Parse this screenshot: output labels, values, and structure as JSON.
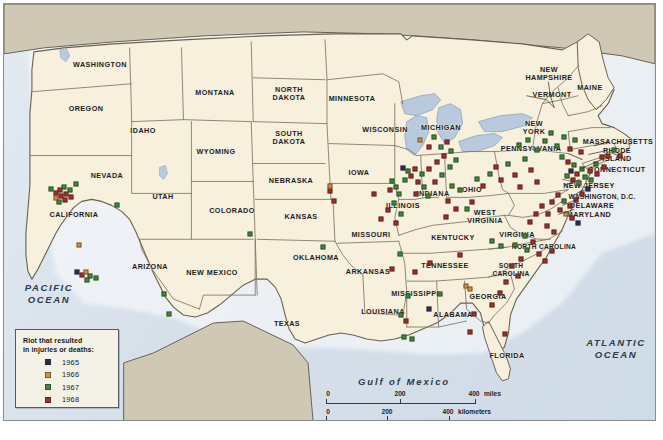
{
  "map": {
    "title": "Riots in the United States 1965-1968",
    "ocean_labels": [
      {
        "name": "pacific-ocean-label",
        "text": "PACIFIC\nOCEAN",
        "x": 45,
        "y": 290
      },
      {
        "name": "atlantic-ocean-label",
        "text": "ATLANTIC\nOCEAN",
        "x": 612,
        "y": 345
      },
      {
        "name": "gulf-of-mexico-label",
        "text": "Gulf of Mexico",
        "x": 400,
        "y": 377
      }
    ],
    "colors": {
      "us_land": "#f6f0dc",
      "foreign_land": "#cfc8b4",
      "water": "#d8e2ec",
      "border": "#6b6050",
      "state_border": "#7d7462",
      "frame": "#8a8d8f",
      "legend_bg": "#f4f1e6",
      "text": "#1d1d1f"
    },
    "states": [
      {
        "name": "WASHINGTON",
        "x": 96,
        "y": 61
      },
      {
        "name": "OREGON",
        "x": 82,
        "y": 105
      },
      {
        "name": "IDAHO",
        "x": 139,
        "y": 127
      },
      {
        "name": "MONTANA",
        "x": 211,
        "y": 89
      },
      {
        "name": "WYOMING",
        "x": 212,
        "y": 148
      },
      {
        "name": "NEVADA",
        "x": 103,
        "y": 172
      },
      {
        "name": "CALIFORNIA",
        "x": 70,
        "y": 211
      },
      {
        "name": "UTAH",
        "x": 159,
        "y": 193
      },
      {
        "name": "ARIZONA",
        "x": 146,
        "y": 263
      },
      {
        "name": "COLORADO",
        "x": 228,
        "y": 207
      },
      {
        "name": "NEW MEXICO",
        "x": 208,
        "y": 269
      },
      {
        "name": "NORTH\nDAKOTA",
        "x": 285,
        "y": 90
      },
      {
        "name": "SOUTH\nDAKOTA",
        "x": 285,
        "y": 134
      },
      {
        "name": "NEBRASKA",
        "x": 287,
        "y": 177
      },
      {
        "name": "KANSAS",
        "x": 297,
        "y": 213
      },
      {
        "name": "OKLAHOMA",
        "x": 312,
        "y": 254
      },
      {
        "name": "TEXAS",
        "x": 283,
        "y": 320
      },
      {
        "name": "MINNESOTA",
        "x": 348,
        "y": 95
      },
      {
        "name": "IOWA",
        "x": 355,
        "y": 169
      },
      {
        "name": "MISSOURI",
        "x": 367,
        "y": 231
      },
      {
        "name": "ARKANSAS",
        "x": 364,
        "y": 268
      },
      {
        "name": "LOUISIANA",
        "x": 379,
        "y": 308
      },
      {
        "name": "WISCONSIN",
        "x": 381,
        "y": 126
      },
      {
        "name": "ILLINOIS",
        "x": 399,
        "y": 202
      },
      {
        "name": "MISSISSIPPI",
        "x": 411,
        "y": 290
      },
      {
        "name": "MICHIGAN",
        "x": 437,
        "y": 124
      },
      {
        "name": "INDIANA",
        "x": 429,
        "y": 190
      },
      {
        "name": "KENTUCKY",
        "x": 449,
        "y": 234
      },
      {
        "name": "TENNESSEE",
        "x": 441,
        "y": 262
      },
      {
        "name": "ALABAMA",
        "x": 449,
        "y": 311
      },
      {
        "name": "OHIO",
        "x": 468,
        "y": 186
      },
      {
        "name": "GEORGIA",
        "x": 484,
        "y": 293
      },
      {
        "name": "FLORIDA",
        "x": 503,
        "y": 352
      },
      {
        "name": "WEST\nVIRGINIA",
        "x": 481,
        "y": 213
      },
      {
        "name": "SOUTH\nCAROLINA",
        "x": 507,
        "y": 266
      },
      {
        "name": "NORTH CAROLINA",
        "x": 540,
        "y": 243
      },
      {
        "name": "VIRGINIA",
        "x": 513,
        "y": 231
      },
      {
        "name": "PENNSYLVANIA",
        "x": 527,
        "y": 145
      },
      {
        "name": "NEW\nYORK",
        "x": 530,
        "y": 124
      },
      {
        "name": "VERMONT",
        "x": 548,
        "y": 91
      },
      {
        "name": "NEW\nHAMPSHIRE",
        "x": 545,
        "y": 70
      },
      {
        "name": "MAINE",
        "x": 586,
        "y": 84
      },
      {
        "name": "MASSACHUSETTS",
        "x": 614,
        "y": 138
      },
      {
        "name": "RHODE\nISLAND",
        "x": 613,
        "y": 151
      },
      {
        "name": "CONNECTICUT",
        "x": 613,
        "y": 166
      },
      {
        "name": "NEW JERSEY",
        "x": 585,
        "y": 182
      },
      {
        "name": "WASHINGTON, D.C.",
        "x": 598,
        "y": 193
      },
      {
        "name": "DELAWARE",
        "x": 588,
        "y": 202
      },
      {
        "name": "MARYLAND",
        "x": 585,
        "y": 211
      }
    ]
  },
  "legend": {
    "name": "map-legend",
    "title_line1": "Riot that resulted",
    "title_line2": "in injuries or deaths:",
    "items": [
      {
        "year": "1965",
        "color": "#2b2c55"
      },
      {
        "year": "1966",
        "color": "#d4923f"
      },
      {
        "year": "1967",
        "color": "#3f8a3a"
      },
      {
        "year": "1968",
        "color": "#a03028"
      }
    ]
  },
  "scale": {
    "name": "map-scale-bar",
    "miles": {
      "ticks": [
        "0",
        "200",
        "400"
      ],
      "unit": "miles"
    },
    "kilometers": {
      "ticks": [
        "0",
        "200",
        "400"
      ],
      "unit": "kilometers"
    }
  },
  "markers": [
    {
      "y": "1967",
      "x": 47,
      "yy": 185
    },
    {
      "y": "1968",
      "x": 52,
      "yy": 189
    },
    {
      "y": "1968",
      "x": 56,
      "yy": 186
    },
    {
      "y": "1967",
      "x": 60,
      "yy": 183
    },
    {
      "y": "1968",
      "x": 57,
      "yy": 192
    },
    {
      "y": "1966",
      "x": 52,
      "yy": 194
    },
    {
      "y": "1968",
      "x": 62,
      "yy": 190
    },
    {
      "y": "1967",
      "x": 66,
      "yy": 186
    },
    {
      "y": "1968",
      "x": 61,
      "yy": 196
    },
    {
      "y": "1967",
      "x": 55,
      "yy": 198
    },
    {
      "y": "1967",
      "x": 72,
      "yy": 180
    },
    {
      "y": "1968",
      "x": 67,
      "yy": 193
    },
    {
      "y": "1966",
      "x": 75,
      "yy": 241
    },
    {
      "y": "1965",
      "x": 73,
      "yy": 268
    },
    {
      "y": "1968",
      "x": 78,
      "yy": 271
    },
    {
      "y": "1966",
      "x": 82,
      "yy": 268
    },
    {
      "y": "1967",
      "x": 86,
      "yy": 272
    },
    {
      "y": "1967",
      "x": 83,
      "yy": 276
    },
    {
      "y": "1967",
      "x": 92,
      "yy": 274
    },
    {
      "y": "1967",
      "x": 160,
      "yy": 290
    },
    {
      "y": "1967",
      "x": 165,
      "yy": 310
    },
    {
      "y": "1967",
      "x": 113,
      "yy": 201
    },
    {
      "y": "1967",
      "x": 246,
      "yy": 230
    },
    {
      "y": "1968",
      "x": 326,
      "yy": 187
    },
    {
      "y": "1966",
      "x": 326,
      "yy": 182
    },
    {
      "y": "1968",
      "x": 330,
      "yy": 197
    },
    {
      "y": "1967",
      "x": 319,
      "yy": 243
    },
    {
      "y": "1968",
      "x": 370,
      "yy": 190
    },
    {
      "y": "1968",
      "x": 377,
      "yy": 215
    },
    {
      "y": "1967",
      "x": 388,
      "yy": 177
    },
    {
      "y": "1968",
      "x": 386,
      "yy": 186
    },
    {
      "y": "1967",
      "x": 392,
      "yy": 183
    },
    {
      "y": "1967",
      "x": 395,
      "yy": 190
    },
    {
      "y": "1967",
      "x": 390,
      "yy": 199
    },
    {
      "y": "1968",
      "x": 384,
      "yy": 206
    },
    {
      "y": "1967",
      "x": 397,
      "yy": 210
    },
    {
      "y": "1968",
      "x": 392,
      "yy": 219
    },
    {
      "y": "1965",
      "x": 399,
      "yy": 164
    },
    {
      "y": "1967",
      "x": 404,
      "yy": 167
    },
    {
      "y": "1968",
      "x": 407,
      "yy": 172
    },
    {
      "y": "1967",
      "x": 401,
      "yy": 176
    },
    {
      "y": "1968",
      "x": 411,
      "yy": 165
    },
    {
      "y": "1968",
      "x": 414,
      "yy": 178
    },
    {
      "y": "1967",
      "x": 418,
      "yy": 170
    },
    {
      "y": "1967",
      "x": 420,
      "yy": 183
    },
    {
      "y": "1968",
      "x": 412,
      "yy": 190
    },
    {
      "y": "1967",
      "x": 424,
      "yy": 192
    },
    {
      "y": "1966",
      "x": 416,
      "yy": 136
    },
    {
      "y": "1968",
      "x": 425,
      "yy": 143
    },
    {
      "y": "1967",
      "x": 430,
      "yy": 133
    },
    {
      "y": "1967",
      "x": 437,
      "yy": 143
    },
    {
      "y": "1968",
      "x": 443,
      "yy": 138
    },
    {
      "y": "1967",
      "x": 447,
      "yy": 147
    },
    {
      "y": "1968",
      "x": 440,
      "yy": 152
    },
    {
      "y": "1967",
      "x": 452,
      "yy": 156
    },
    {
      "y": "1968",
      "x": 433,
      "yy": 158
    },
    {
      "y": "1967",
      "x": 446,
      "yy": 163
    },
    {
      "y": "1968",
      "x": 425,
      "yy": 165
    },
    {
      "y": "1967",
      "x": 438,
      "yy": 171
    },
    {
      "y": "1968",
      "x": 431,
      "yy": 178
    },
    {
      "y": "1967",
      "x": 448,
      "yy": 182
    },
    {
      "y": "1967",
      "x": 456,
      "yy": 186
    },
    {
      "y": "1968",
      "x": 444,
      "yy": 197
    },
    {
      "y": "1968",
      "x": 452,
      "yy": 205
    },
    {
      "y": "1968",
      "x": 442,
      "yy": 213
    },
    {
      "y": "1967",
      "x": 463,
      "yy": 205
    },
    {
      "y": "1968",
      "x": 468,
      "yy": 198
    },
    {
      "y": "1967",
      "x": 473,
      "yy": 175
    },
    {
      "y": "1968",
      "x": 479,
      "yy": 182
    },
    {
      "y": "1967",
      "x": 486,
      "yy": 170
    },
    {
      "y": "1968",
      "x": 492,
      "yy": 163
    },
    {
      "y": "1968",
      "x": 497,
      "yy": 176
    },
    {
      "y": "1967",
      "x": 504,
      "yy": 160
    },
    {
      "y": "1968",
      "x": 511,
      "yy": 171
    },
    {
      "y": "1968",
      "x": 516,
      "yy": 183
    },
    {
      "y": "1967",
      "x": 521,
      "yy": 155
    },
    {
      "y": "1968",
      "x": 527,
      "yy": 166
    },
    {
      "y": "1968",
      "x": 533,
      "yy": 178
    },
    {
      "y": "1967",
      "x": 515,
      "yy": 141
    },
    {
      "y": "1967",
      "x": 524,
      "yy": 136
    },
    {
      "y": "1967",
      "x": 533,
      "yy": 146
    },
    {
      "y": "1967",
      "x": 541,
      "yy": 137
    },
    {
      "y": "1967",
      "x": 547,
      "yy": 129
    },
    {
      "y": "1967",
      "x": 553,
      "yy": 142
    },
    {
      "y": "1967",
      "x": 560,
      "yy": 133
    },
    {
      "y": "1968",
      "x": 566,
      "yy": 145
    },
    {
      "y": "1967",
      "x": 571,
      "yy": 136
    },
    {
      "y": "1968",
      "x": 577,
      "yy": 148
    },
    {
      "y": "1967",
      "x": 558,
      "yy": 153
    },
    {
      "y": "1968",
      "x": 564,
      "yy": 158
    },
    {
      "y": "1967",
      "x": 570,
      "yy": 161
    },
    {
      "y": "1965",
      "x": 567,
      "yy": 167
    },
    {
      "y": "1968",
      "x": 573,
      "yy": 170
    },
    {
      "y": "1967",
      "x": 578,
      "yy": 165
    },
    {
      "y": "1967",
      "x": 563,
      "yy": 172
    },
    {
      "y": "1968",
      "x": 569,
      "yy": 176
    },
    {
      "y": "1967",
      "x": 575,
      "yy": 179
    },
    {
      "y": "1967",
      "x": 581,
      "yy": 173
    },
    {
      "y": "1968",
      "x": 586,
      "yy": 167
    },
    {
      "y": "1967",
      "x": 592,
      "yy": 160
    },
    {
      "y": "1968",
      "x": 598,
      "yy": 153
    },
    {
      "y": "1967",
      "x": 587,
      "yy": 176
    },
    {
      "y": "1968",
      "x": 593,
      "yy": 170
    },
    {
      "y": "1968",
      "x": 600,
      "yy": 163
    },
    {
      "y": "1968",
      "x": 604,
      "yy": 152
    },
    {
      "y": "1967",
      "x": 610,
      "yy": 146
    },
    {
      "y": "1968",
      "x": 616,
      "yy": 152
    },
    {
      "y": "1965",
      "x": 584,
      "yy": 185
    },
    {
      "y": "1968",
      "x": 578,
      "yy": 190
    },
    {
      "y": "1968",
      "x": 572,
      "yy": 196
    },
    {
      "y": "1968",
      "x": 566,
      "yy": 202
    },
    {
      "y": "1967",
      "x": 560,
      "yy": 197
    },
    {
      "y": "1968",
      "x": 554,
      "yy": 191
    },
    {
      "y": "1968",
      "x": 548,
      "yy": 198
    },
    {
      "y": "1968",
      "x": 556,
      "yy": 206
    },
    {
      "y": "1966",
      "x": 562,
      "yy": 210
    },
    {
      "y": "1968",
      "x": 568,
      "yy": 214
    },
    {
      "y": "1965",
      "x": 574,
      "yy": 219
    },
    {
      "y": "1968",
      "x": 544,
      "yy": 210
    },
    {
      "y": "1968",
      "x": 538,
      "yy": 202
    },
    {
      "y": "1968",
      "x": 532,
      "yy": 210
    },
    {
      "y": "1968",
      "x": 526,
      "yy": 218
    },
    {
      "y": "1968",
      "x": 543,
      "yy": 222
    },
    {
      "y": "1968",
      "x": 550,
      "yy": 228
    },
    {
      "y": "1967",
      "x": 521,
      "yy": 232
    },
    {
      "y": "1968",
      "x": 529,
      "yy": 238
    },
    {
      "y": "1967",
      "x": 511,
      "yy": 241
    },
    {
      "y": "1967",
      "x": 523,
      "yy": 246
    },
    {
      "y": "1968",
      "x": 535,
      "yy": 250
    },
    {
      "y": "1968",
      "x": 548,
      "yy": 247
    },
    {
      "y": "1968",
      "x": 541,
      "yy": 257
    },
    {
      "y": "1968",
      "x": 517,
      "yy": 255
    },
    {
      "y": "1968",
      "x": 508,
      "yy": 262
    },
    {
      "y": "1968",
      "x": 514,
      "yy": 272
    },
    {
      "y": "1968",
      "x": 502,
      "yy": 278
    },
    {
      "y": "1968",
      "x": 496,
      "yy": 289
    },
    {
      "y": "1968",
      "x": 488,
      "yy": 301
    },
    {
      "y": "1966",
      "x": 462,
      "yy": 282
    },
    {
      "y": "1966",
      "x": 466,
      "yy": 285
    },
    {
      "y": "1965",
      "x": 425,
      "yy": 305
    },
    {
      "y": "1967",
      "x": 436,
      "yy": 290
    },
    {
      "y": "1968",
      "x": 470,
      "yy": 310
    },
    {
      "y": "1968",
      "x": 466,
      "yy": 328
    },
    {
      "y": "1968",
      "x": 501,
      "yy": 330
    },
    {
      "y": "1967",
      "x": 404,
      "yy": 292
    },
    {
      "y": "1967",
      "x": 397,
      "yy": 311
    },
    {
      "y": "1968",
      "x": 402,
      "yy": 317
    },
    {
      "y": "1967",
      "x": 400,
      "yy": 333
    },
    {
      "y": "1967",
      "x": 408,
      "yy": 335
    },
    {
      "y": "1968",
      "x": 388,
      "yy": 265
    },
    {
      "y": "1968",
      "x": 426,
      "yy": 259
    },
    {
      "y": "1967",
      "x": 396,
      "yy": 250
    },
    {
      "y": "1968",
      "x": 411,
      "yy": 268
    },
    {
      "y": "1968",
      "x": 456,
      "yy": 251
    },
    {
      "y": "1967",
      "x": 497,
      "yy": 242
    },
    {
      "y": "1967",
      "x": 488,
      "yy": 237
    }
  ]
}
